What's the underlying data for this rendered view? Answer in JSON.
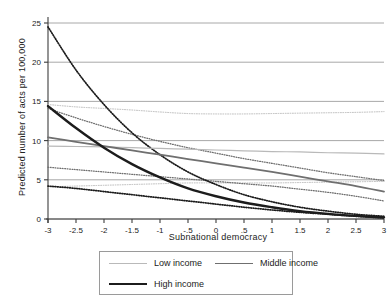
{
  "chart_data": {
    "type": "line",
    "title": "",
    "xlabel": "Subnational democracy",
    "ylabel": "Predicted  number of acts per 100,000",
    "xlim": [
      -3,
      3
    ],
    "ylim": [
      0,
      25
    ],
    "grid": true,
    "xticks": [
      "-3",
      "-2.5",
      "-2",
      "-1.5",
      "-1",
      "-.5",
      "0",
      ".5",
      "1",
      "1.5",
      "2",
      "2.5",
      "3"
    ],
    "xtick_values": [
      -3,
      -2.5,
      -2,
      -1.5,
      -1,
      -0.5,
      0,
      0.5,
      1,
      1.5,
      2,
      2.5,
      3
    ],
    "yticks": [
      "0",
      "5",
      "10",
      "15",
      "20",
      "25"
    ],
    "ytick_values": [
      0,
      5,
      10,
      15,
      20,
      25
    ],
    "legend_position": "below",
    "x": [
      -3,
      -2.5,
      -2,
      -1.5,
      -1,
      -0.5,
      0,
      0.5,
      1,
      1.5,
      2,
      2.5,
      3
    ],
    "series": [
      {
        "name": "Low income",
        "style": "solid",
        "color": "#b9b9b9",
        "width": 1.2,
        "values": [
          9.3,
          9.25,
          9.2,
          9.1,
          9.0,
          8.9,
          8.8,
          8.7,
          8.6,
          8.55,
          8.45,
          8.4,
          8.3
        ],
        "ci_upper": {
          "style": "dotted",
          "values": [
            14.6,
            14.3,
            14.1,
            13.9,
            13.65,
            13.45,
            13.4,
            13.4,
            13.45,
            13.5,
            13.55,
            13.6,
            13.7
          ]
        },
        "ci_lower": {
          "style": "dotted",
          "values": [
            4.1,
            4.2,
            4.3,
            4.4,
            4.5,
            4.6,
            4.6,
            4.6,
            4.6,
            4.65,
            4.7,
            4.75,
            4.8
          ]
        }
      },
      {
        "name": "Middle income",
        "style": "solid",
        "color": "#6f6f6f",
        "width": 1.8,
        "values": [
          10.4,
          9.85,
          9.3,
          8.75,
          8.2,
          7.65,
          7.1,
          6.55,
          6.0,
          5.4,
          4.8,
          4.2,
          3.5
        ],
        "ci_upper": {
          "style": "dotted",
          "values": [
            14.1,
            12.9,
            11.8,
            10.8,
            9.9,
            9.1,
            8.4,
            7.7,
            7.1,
            6.5,
            5.9,
            5.4,
            4.9
          ]
        },
        "ci_lower": {
          "style": "dotted",
          "values": [
            6.6,
            6.3,
            6.0,
            5.7,
            5.4,
            5.1,
            4.8,
            4.5,
            4.2,
            3.8,
            3.4,
            2.9,
            2.3
          ]
        }
      },
      {
        "name": "High income",
        "style": "solid",
        "color": "#1c1c1c",
        "width": 2.4,
        "values": [
          14.4,
          11.6,
          9.1,
          7.0,
          5.3,
          3.9,
          2.9,
          2.1,
          1.5,
          1.0,
          0.65,
          0.4,
          0.2
        ],
        "ci_upper": {
          "style": "dotted",
          "values": [
            24.5,
            19.0,
            14.6,
            11.0,
            8.2,
            6.0,
            4.4,
            3.1,
            2.2,
            1.5,
            1.0,
            0.6,
            0.35
          ]
        },
        "ci_lower": {
          "style": "dotted",
          "values": [
            4.2,
            3.9,
            3.5,
            3.1,
            2.7,
            2.3,
            1.9,
            1.5,
            1.15,
            0.85,
            0.6,
            0.35,
            0.15
          ]
        }
      }
    ]
  },
  "axis": {
    "xlabel": "Subnational democracy",
    "ylabel": "Predicted  number of acts per 100,000"
  },
  "legend": {
    "items": [
      {
        "label": "Low income"
      },
      {
        "label": "Middle income"
      },
      {
        "label": "High income"
      }
    ]
  }
}
